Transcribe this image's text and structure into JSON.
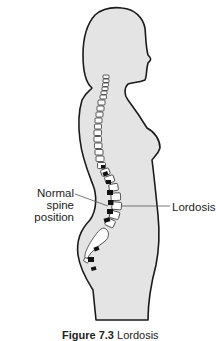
{
  "figure": {
    "labels": {
      "normal_spine_line1": "Normal spine",
      "normal_spine_line2": "position",
      "lordosis": "Lordosis"
    },
    "caption": {
      "number": "Figure 7.3",
      "text": "Lordosis"
    },
    "colors": {
      "body_fill": "#e4e4e4",
      "outline": "#1a1a1a",
      "vertebra_fill": "#ffffff",
      "normal_spine_marker": "#111111",
      "leader_line": "#555555"
    }
  }
}
